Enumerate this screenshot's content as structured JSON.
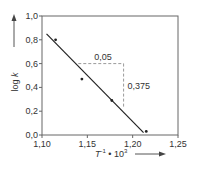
{
  "chart_data": {
    "type": "scatter",
    "title": "",
    "xlabel": "T⁻¹ • 10³",
    "xlabel_parts": {
      "base": "T",
      "sup1": "-1",
      "mid": " • 10",
      "sup2": "3"
    },
    "ylabel": "log k",
    "xlim": [
      1.1,
      1.25
    ],
    "ylim": [
      0.0,
      1.0
    ],
    "x_ticks": [
      1.1,
      1.15,
      1.2,
      1.25
    ],
    "x_tick_labels": [
      "1,10",
      "1,15",
      "1,20",
      "1,25"
    ],
    "y_ticks": [
      0.0,
      0.2,
      0.4,
      0.6,
      0.8,
      1.0
    ],
    "y_tick_labels": [
      "0,0",
      "0,2",
      "0,4",
      "0,6",
      "0,8",
      "1,0"
    ],
    "grid": false,
    "series": [
      {
        "name": "measured",
        "points": [
          {
            "x": 1.115,
            "y": 0.8
          },
          {
            "x": 1.144,
            "y": 0.47
          },
          {
            "x": 1.177,
            "y": 0.29
          },
          {
            "x": 1.215,
            "y": 0.03
          }
        ]
      }
    ],
    "fit_line": {
      "x1": 1.105,
      "y1": 0.85,
      "x2": 1.212,
      "y2": 0.02
    },
    "slope_triangle": {
      "x_start": 1.14,
      "x_end": 1.19,
      "y_top": 0.6,
      "y_bottom": 0.225,
      "dx_label": "0,05",
      "dy_label": "0,375"
    },
    "colors": {
      "line": "#222222",
      "axis": "#555555",
      "dashed": "#9a9a9a",
      "point": "#222222"
    }
  }
}
